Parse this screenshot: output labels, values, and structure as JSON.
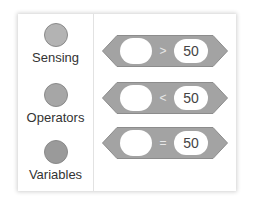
{
  "colors": {
    "block_fill": "#a3a3a3",
    "block_stroke": "#8c8c8c",
    "sensing_dot": "#b3b3b3",
    "operators_dot": "#a6a6a6",
    "variables_dot": "#9a9a9a"
  },
  "categories": [
    {
      "label": "Sensing",
      "icon": "sensing-dot-icon"
    },
    {
      "label": "Operators",
      "icon": "operators-dot-icon"
    },
    {
      "label": "Variables",
      "icon": "variables-dot-icon"
    }
  ],
  "blocks": [
    {
      "left_value": "",
      "operator": ">",
      "right_value": "50"
    },
    {
      "left_value": "",
      "operator": "<",
      "right_value": "50"
    },
    {
      "left_value": "",
      "operator": "=",
      "right_value": "50"
    }
  ]
}
